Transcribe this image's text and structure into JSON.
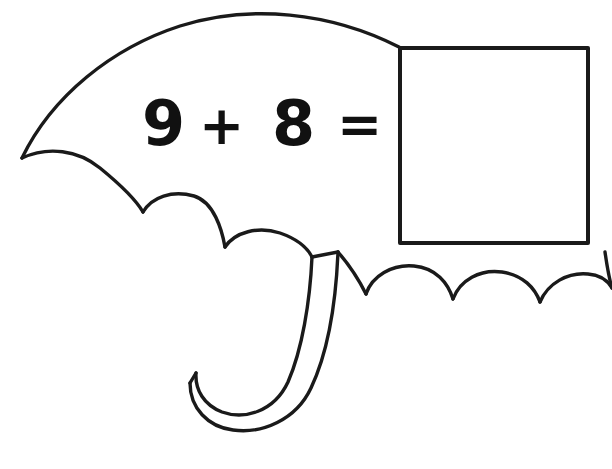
{
  "page": {
    "kind": "math-worksheet-coloring-page",
    "background_color": "#ffffff",
    "ink_color": "#1a1a1a",
    "width": 612,
    "height": 469
  },
  "illustration": {
    "name": "umbrella",
    "description": "Black outline drawing of an open umbrella with a scalloped canopy edge and a J-shaped curved handle",
    "parts": {
      "canopy_label": "umbrella canopy",
      "scallop_label": "scalloped canopy edge",
      "handle_label": "umbrella handle"
    }
  },
  "problem": {
    "addend1": "9",
    "operator": "+",
    "addend2": "8",
    "equals": "=",
    "answer": "",
    "answer_placeholder": ""
  },
  "answer_box": {
    "label": "answer box",
    "x": 400,
    "y": 48,
    "width": 188,
    "height": 195,
    "border_color": "#1a1a1a",
    "fill_color": "#ffffff"
  }
}
